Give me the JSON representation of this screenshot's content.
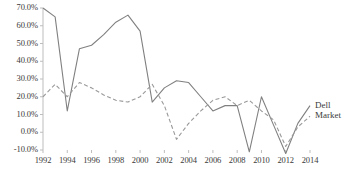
{
  "chart_data": {
    "type": "line",
    "title": "",
    "xlabel": "",
    "ylabel": "",
    "grid": false,
    "legend_position": "inline-right",
    "x": [
      1992,
      1993,
      1994,
      1995,
      1996,
      1997,
      1998,
      1999,
      2000,
      2001,
      2002,
      2003,
      2004,
      2005,
      2006,
      2007,
      2008,
      2009,
      2010,
      2011,
      2012,
      2013,
      2014
    ],
    "xtick_labels": [
      "1992",
      "1994",
      "1996",
      "1998",
      "2000",
      "2002",
      "2004",
      "2006",
      "2008",
      "2010",
      "2012",
      "2014"
    ],
    "xtick_values": [
      1992,
      1994,
      1996,
      1998,
      2000,
      2002,
      2004,
      2006,
      2008,
      2010,
      2012,
      2014
    ],
    "ytick_labels": [
      "70.0%",
      "60.0%",
      "50.0%",
      "40.0%",
      "30.0%",
      "20.0%",
      "10.0%",
      "0.0%",
      "-10.0%"
    ],
    "ytick_values": [
      70,
      60,
      50,
      40,
      30,
      20,
      10,
      0,
      -10
    ],
    "ylim": [
      -10,
      70
    ],
    "xlim": [
      1992,
      2014
    ],
    "yunit": "%",
    "series": [
      {
        "name": "Dell",
        "style": "solid",
        "color": "#808080",
        "values": [
          70,
          65,
          12,
          47,
          49,
          55,
          62,
          66,
          57,
          17,
          25,
          29,
          28,
          20,
          12,
          15,
          15,
          -11,
          20,
          4,
          -12,
          5,
          15
        ]
      },
      {
        "name": "Market",
        "style": "dashed",
        "color": "#999999",
        "values": [
          20,
          27,
          20,
          28,
          25,
          21,
          18,
          17,
          20,
          27,
          15,
          -4,
          5,
          12,
          18,
          20,
          15,
          18,
          12,
          7,
          -8,
          3,
          9
        ]
      }
    ]
  },
  "axis": {
    "axis_color": "#bdbdbd",
    "text_color": "#3a3a3a"
  }
}
